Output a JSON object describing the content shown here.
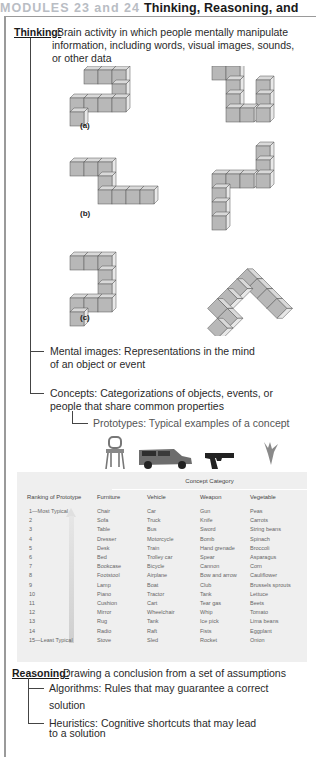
{
  "header": {
    "module_label": "MODULES 23 and 24",
    "title": "Thinking, Reasoning, and"
  },
  "thinking": {
    "term": "Thinking:",
    "definition_lines": [
      "Brain activity in which people mentally manipulate",
      "information, including words, visual images, sounds,",
      "or other data"
    ]
  },
  "figure": {
    "labels": [
      "(a)",
      "(b)",
      "(c)"
    ]
  },
  "mental_images": {
    "lines": [
      "Mental images: Representations in the mind",
      "of an object or event"
    ]
  },
  "concepts": {
    "lines": [
      "Concepts: Categorizations of objects, events, or",
      "people that share common properties"
    ]
  },
  "prototypes": {
    "text": "Prototypes: Typical examples of a concept"
  },
  "icons": [
    "chair-icon",
    "car-icon",
    "gun-icon",
    "vegetable-icon"
  ],
  "table": {
    "caption": "Concept Category",
    "headers": [
      "Ranking of Prototype",
      "Furniture",
      "Vehicle",
      "Weapon",
      "Vegetable"
    ],
    "ranks": [
      "1—Most Typical",
      "2",
      "3",
      "4",
      "5",
      "6",
      "7",
      "8",
      "9",
      "10",
      "11",
      "12",
      "13",
      "14",
      "15—Least Typical"
    ],
    "furniture": [
      "Chair",
      "Sofa",
      "Table",
      "Dresser",
      "Desk",
      "Bed",
      "Bookcase",
      "Footstool",
      "Lamp",
      "Piano",
      "Cushion",
      "Mirror",
      "Rug",
      "Radio",
      "Stove"
    ],
    "vehicle": [
      "Car",
      "Truck",
      "Bus",
      "Motorcycle",
      "Train",
      "Trolley car",
      "Bicycle",
      "Airplane",
      "Boat",
      "Tractor",
      "Cart",
      "Wheelchair",
      "Tank",
      "Raft",
      "Sled"
    ],
    "weapon": [
      "Gun",
      "Knife",
      "Sword",
      "Bomb",
      "Hand grenade",
      "Spear",
      "Cannon",
      "Bow and arrow",
      "Club",
      "Tank",
      "Tear gas",
      "Whip",
      "Ice pick",
      "Fists",
      "Rocket"
    ],
    "vegetable": [
      "Peas",
      "Carrots",
      "String beans",
      "Spinach",
      "Broccoli",
      "Asparagus",
      "Corn",
      "Cauliflower",
      "Brussels sprouts",
      "Lettuce",
      "Beets",
      "Tomato",
      "Lima beans",
      "Eggplant",
      "Onion"
    ]
  },
  "reasoning": {
    "term": "Reasoning:",
    "definition": "Drawing a conclusion from a set of assumptions"
  },
  "algorithms": {
    "lines": [
      "Algorithms: Rules that may guarantee a correct",
      "solution"
    ]
  },
  "heuristics": {
    "lines": [
      "Heuristics: Cognitive shortcuts that may lead",
      "to a solution"
    ]
  },
  "colors": {
    "module_label": "#b9bdc4",
    "table_bg": "#efefef",
    "cube_face": "#b8b8b8"
  }
}
